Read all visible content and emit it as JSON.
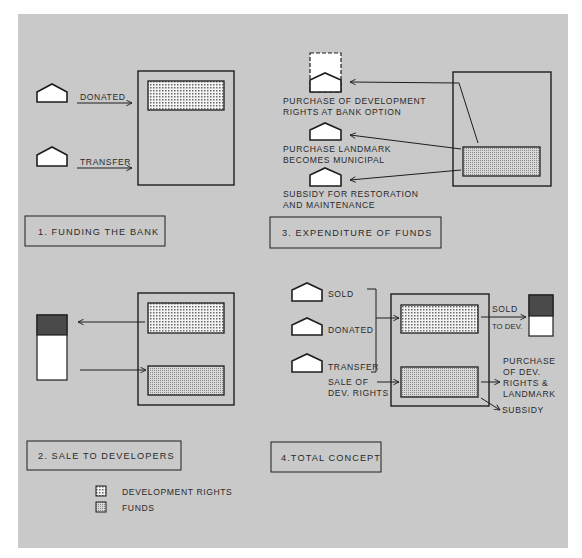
{
  "colors": {
    "page": "#ffffff",
    "panel": "#c9c9c9",
    "ink": "#1e1e1e",
    "building_fill": "#ffffff",
    "developer_top": "#4a4a4a"
  },
  "legend": {
    "items": [
      {
        "label": "DEVELOPMENT RIGHTS",
        "pattern": "dots-coarse"
      },
      {
        "label": "FUNDS",
        "pattern": "dots-fine"
      }
    ]
  },
  "panels": [
    {
      "id": 1,
      "title": "1. FUNDING THE BANK",
      "sources": [
        {
          "label": "DONATED"
        },
        {
          "label": "TRANSFER"
        }
      ]
    },
    {
      "id": 2,
      "title": "2. SALE TO DEVELOPERS"
    },
    {
      "id": 3,
      "title": "3. EXPENDITURE OF FUNDS",
      "uses": [
        {
          "line1": "PURCHASE OF DEVELOPMENT",
          "line2": "RIGHTS AT BANK OPTION"
        },
        {
          "line1": "PURCHASE  LANDMARK",
          "line2": "BECOMES MUNICIPAL"
        },
        {
          "line1": "SUBSIDY  FOR  RESTORATION",
          "line2": "AND  MAINTENANCE"
        }
      ]
    },
    {
      "id": 4,
      "title": "4.TOTAL  CONCEPT",
      "inputs": [
        {
          "label": "SOLD"
        },
        {
          "label": "DONATED"
        },
        {
          "label": "TRANSFER"
        }
      ],
      "sale_input": {
        "line1": "SALE  OF",
        "line2": "DEV. RIGHTS"
      },
      "outputs": {
        "sold_line1": "SOLD",
        "sold_line2": "TO DEV.",
        "purchase": [
          "PURCHASE",
          "OF DEV.",
          "RIGHTS  &",
          "LANDMARK"
        ],
        "subsidy": "SUBSIDY"
      }
    }
  ]
}
